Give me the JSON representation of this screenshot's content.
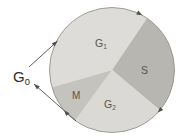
{
  "figure": {
    "kind": "cell-cycle-diagram",
    "background": "#ffffff",
    "width": 191,
    "height": 140
  },
  "cycle": {
    "circle": {
      "cx": 112,
      "cy": 70,
      "r": 62.5,
      "stroke": "#94928c",
      "stroke_width": 0.9
    },
    "label_color": "#57554e",
    "arrow_color": "#514f49",
    "sectors": [
      {
        "id": "g1",
        "base": "G",
        "sub": "1",
        "start": 56,
        "end": 196,
        "fill": "#dedcd8",
        "lx": 95,
        "ly": 47,
        "fsize": 10.5
      },
      {
        "id": "s",
        "base": "S",
        "sub": "",
        "start": -40,
        "end": 56,
        "fill": "#b8b6b0",
        "lx": 141,
        "ly": 74,
        "fsize": 10.5
      },
      {
        "id": "g2",
        "base": "G",
        "sub": "2",
        "start": 234,
        "end": 320,
        "fill": "#dbd9d5",
        "lx": 104,
        "ly": 108,
        "fsize": 10.5
      },
      {
        "id": "m",
        "base": "M",
        "sub": "",
        "start": 196,
        "end": 234,
        "fill": "#c5c3bd",
        "lx": 72,
        "ly": 99,
        "fsize": 10
      }
    ],
    "direction_markers": [
      {
        "angle": 61
      },
      {
        "angle": -43
      },
      {
        "angle": 220
      }
    ]
  },
  "g0": {
    "base": "G",
    "sub": "0",
    "x": 13,
    "y": 82,
    "fsize": 15,
    "color": "#2e2d28",
    "entry_arrow": {
      "x1": 29,
      "y1": 67,
      "x2": 57.5,
      "y2": 41
    },
    "exit_arrow": {
      "x1": 76,
      "y1": 121,
      "x2": 34,
      "y2": 84
    }
  }
}
